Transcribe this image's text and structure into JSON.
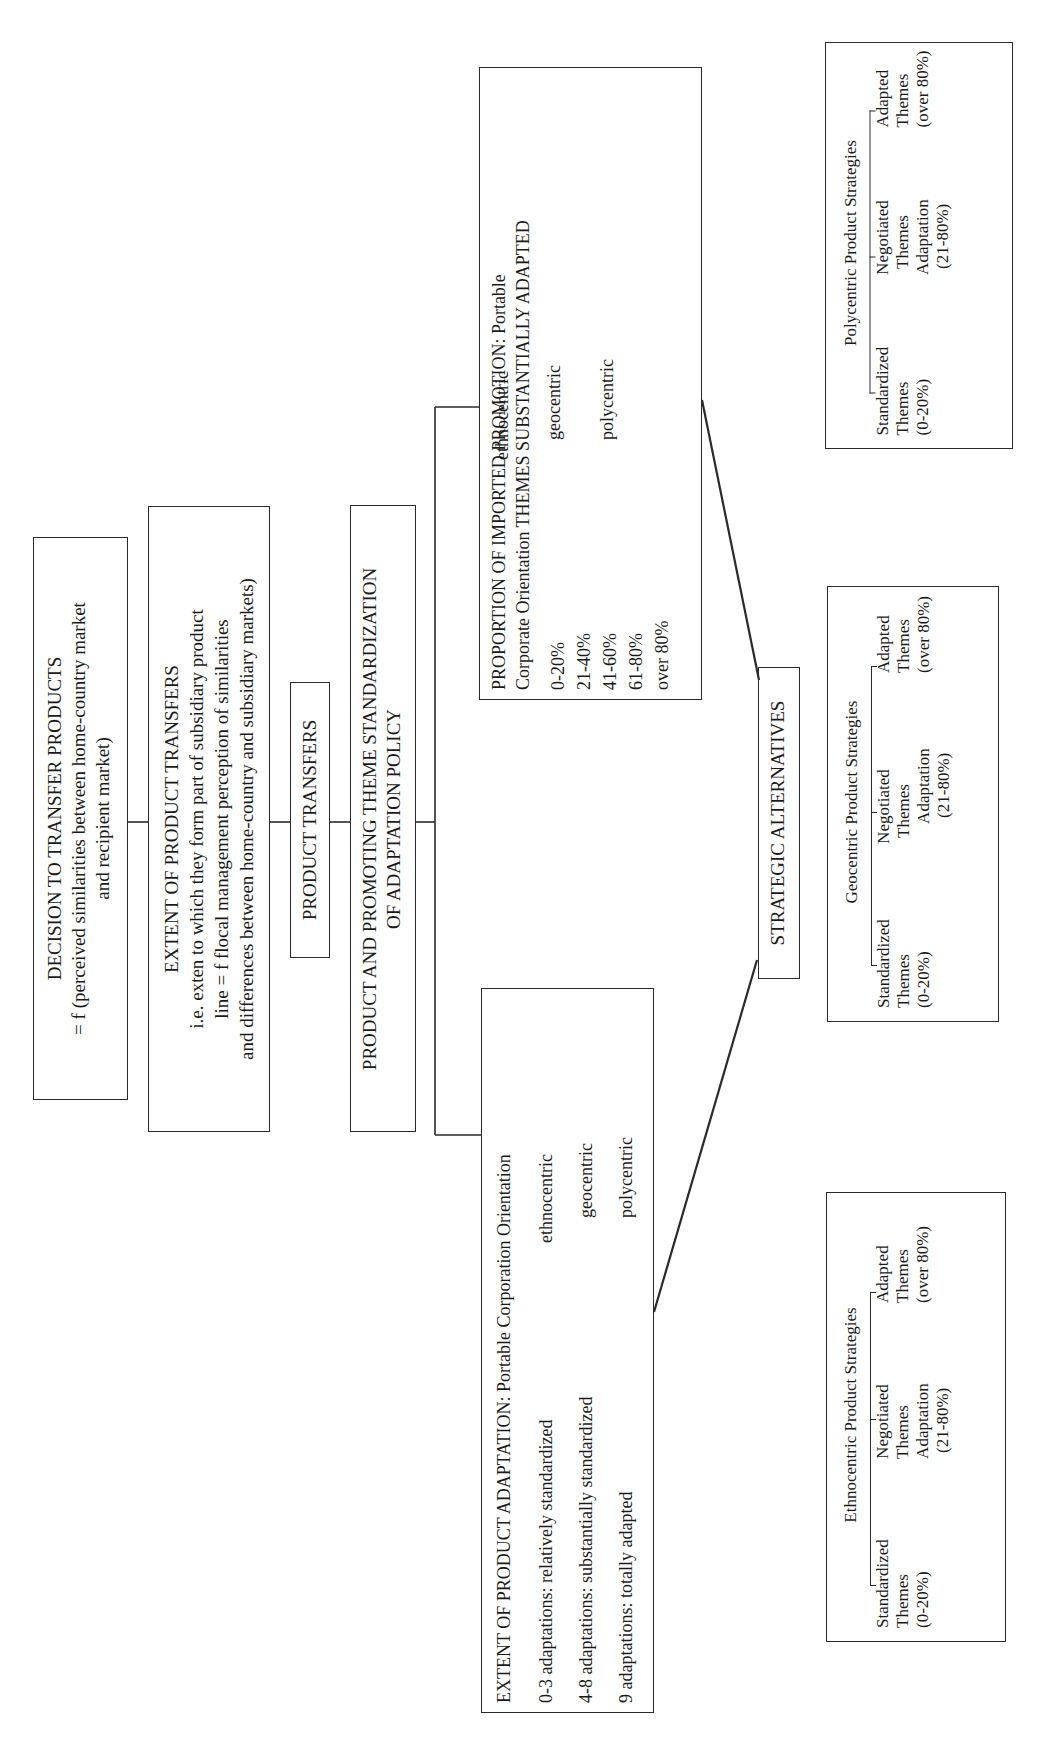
{
  "diagram": {
    "orientation": "rotated 90 degrees counter-clockwise",
    "decision_box": {
      "title": "DECISION TO TRANSFER PRODUCTS",
      "line1": "= f (perceived similarities between home-country market",
      "line2": "and recipient market)"
    },
    "extent_transfers_box": {
      "title": "EXTENT OF PRODUCT TRANSFERS",
      "line1": "i.e. exten to which they form part of subsidiary product",
      "line2": "line = f flocal management perception of similarities",
      "line3": "and differences between home-country and subsidiary markets)"
    },
    "product_transfers_box": {
      "title": "PRODUCT TRANSFERS"
    },
    "policy_box": {
      "line1": "PRODUCT AND PROMOTING THEME STANDARDIZATION",
      "line2": "OF ADAPTATION POLICY"
    },
    "promotion_box": {
      "title_line1": "PROPORTION OF IMPORTED PROMOTION: Portable",
      "title_line2": "Corporate Orientation THEMES SUBSTANTIALLY ADAPTED",
      "ranges": [
        "0-20%",
        "21-40%",
        "41-60%",
        "61-80%",
        "over 80%"
      ],
      "orientations": [
        "ethnocentric",
        "geocentric",
        "polycentric"
      ]
    },
    "adaptation_box": {
      "title": "EXTENT OF PRODUCT ADAPTATION: Portable Corporation Orientation",
      "rows": [
        {
          "label": "0-3 adaptations: relatively standardized",
          "orientation": "ethnocentric"
        },
        {
          "label": "4-8 adaptations: substantially standardized",
          "orientation": "geocentric"
        },
        {
          "label": "9 adaptations: totally adapted",
          "orientation": "polycentric"
        }
      ]
    },
    "strategic_box": {
      "title": "STRATEGIC ALTERNATIVES"
    },
    "strategy_boxes": [
      {
        "id": "polycentric",
        "title": "Polycentric Product Strategies",
        "col1": [
          "Standardized",
          "Themes",
          "(0-20%)"
        ],
        "col2": [
          "Negotiated",
          "Themes",
          "Adaptation",
          "(21-80%)"
        ],
        "col3": [
          "Adapted",
          "Themes",
          "(over 80%)"
        ]
      },
      {
        "id": "geocentric",
        "title": "Geocentric Product Strategies",
        "col1": [
          "Standardized",
          "Themes",
          "(0-20%)"
        ],
        "col2": [
          "Negotiated",
          "Themes",
          "Adaptation",
          "(21-80%)"
        ],
        "col3": [
          "Adapted",
          "Themes",
          "(over 80%)"
        ]
      },
      {
        "id": "ethnocentric",
        "title": "Ethnocentric Product Strategies",
        "col1": [
          "Standardized",
          "Themes",
          "(0-20%)"
        ],
        "col2": [
          "Negotiated",
          "Themes",
          "Adaptation",
          "(21-80%)"
        ],
        "col3": [
          "Adapted",
          "Themes",
          "(over 80%)"
        ]
      }
    ]
  }
}
